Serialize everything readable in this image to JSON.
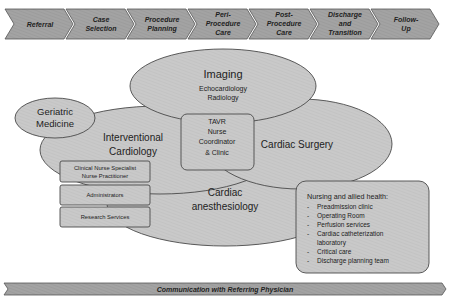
{
  "process_steps": [
    {
      "lines": [
        "Referral"
      ]
    },
    {
      "lines": [
        "Case",
        "Selection"
      ]
    },
    {
      "lines": [
        "Procedure",
        "Planning"
      ]
    },
    {
      "lines": [
        "Peri-",
        "Procedure",
        "Care"
      ]
    },
    {
      "lines": [
        "Post-",
        "Procedure",
        "Care"
      ]
    },
    {
      "lines": [
        "Discharge",
        "and",
        "Transition"
      ]
    },
    {
      "lines": [
        "Follow-",
        "Up"
      ]
    }
  ],
  "imaging": {
    "title": "Imaging",
    "items": [
      "Echocardiology",
      "Radiology"
    ]
  },
  "geriatric": {
    "line1": "Geriatric",
    "line2": "Medicine"
  },
  "interventional": {
    "line1": "Interventional",
    "line2": "Cardiology"
  },
  "tavr": {
    "lines": [
      "TAVR",
      "Nurse",
      "Coordinator",
      "& Clinic"
    ]
  },
  "cardiac_surgery": {
    "label": "Cardiac Surgery"
  },
  "anesthesiology": {
    "line1": "Cardiac",
    "line2": "anesthesiology"
  },
  "support_boxes": [
    {
      "lines": [
        "Clinical Nurse Specialist",
        "Nurse Practitioner"
      ]
    },
    {
      "lines": [
        "Administrators"
      ]
    },
    {
      "lines": [
        "Research Services"
      ]
    }
  ],
  "nursing": {
    "title": "Nursing and allied health:",
    "items": [
      "Preadmission clinic",
      "Operating Room",
      "Perfusion services",
      "Cardiac catheterization",
      "laboratory",
      "Critical care",
      "Discharge planning team"
    ]
  },
  "footer_banner": {
    "label": "Communication with Referring Physician"
  },
  "colors": {
    "fill": "#c8c8c8",
    "stroke": "#4a4a4a",
    "chevron": "#9a9a9a"
  }
}
